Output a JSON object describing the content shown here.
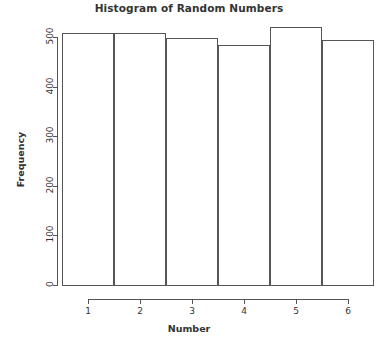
{
  "chart_data": {
    "type": "bar",
    "title": "Histogram of Random Numbers",
    "xlabel": "Number",
    "ylabel": "Frequency",
    "categories": [
      "1",
      "2",
      "3",
      "4",
      "5",
      "6"
    ],
    "values": [
      508,
      509,
      497,
      484,
      520,
      494
    ],
    "xtick_labels": [
      "1",
      "2",
      "3",
      "4",
      "5",
      "6"
    ],
    "ytick_labels": [
      "0",
      "100",
      "200",
      "300",
      "400",
      "500"
    ],
    "ytick_values": [
      0,
      100,
      200,
      300,
      400,
      500
    ],
    "ylim": [
      0,
      530
    ],
    "xlim": [
      0.5,
      6.5
    ],
    "grid": false,
    "legend": false,
    "bar_fill_color": "#ffffff",
    "bar_border_color": "#555555",
    "axis_color": "#555555",
    "text_color": "#333333",
    "background_color": "#ffffff"
  }
}
